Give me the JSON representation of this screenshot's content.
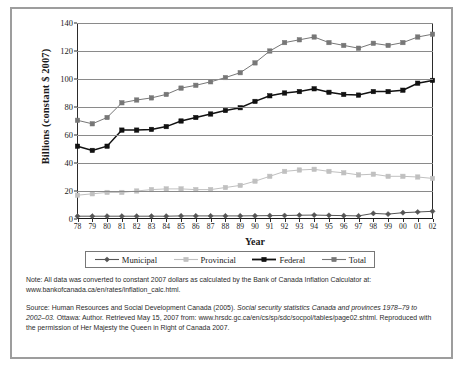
{
  "chart_data": {
    "type": "line",
    "title": "",
    "xlabel": "Year",
    "ylabel": "Billions (constant $ 2007)",
    "ylim": [
      0,
      140
    ],
    "ytick_values": [
      0,
      20,
      40,
      60,
      80,
      100,
      120,
      140
    ],
    "ytick_labels": [
      "0",
      "20",
      "40",
      "60",
      "80",
      "100",
      "120",
      "140"
    ],
    "grid": true,
    "legend_position": "below-axes",
    "categories": [
      "78",
      "79",
      "80",
      "81",
      "82",
      "83",
      "84",
      "85",
      "86",
      "87",
      "88",
      "89",
      "90",
      "91",
      "92",
      "93",
      "94",
      "95",
      "96",
      "97",
      "98",
      "99",
      "00",
      "01",
      "02"
    ],
    "series": [
      {
        "name": "Municipal",
        "color": "#555555",
        "marker": "diamond",
        "values": [
          2.0,
          2.0,
          2.0,
          2.0,
          2.0,
          2.0,
          2.0,
          2.2,
          2.2,
          2.2,
          2.2,
          2.2,
          2.3,
          2.4,
          2.5,
          2.7,
          2.8,
          2.6,
          2.4,
          2.2,
          4.0,
          3.5,
          4.5,
          5.0,
          5.5
        ]
      },
      {
        "name": "Provincial",
        "color": "#c0c0c0",
        "marker": "square",
        "values": [
          17.0,
          18.0,
          19.0,
          19.0,
          20.0,
          21.0,
          21.5,
          21.5,
          21.0,
          21.0,
          22.5,
          24.0,
          27.0,
          30.5,
          34.0,
          35.0,
          35.5,
          34.0,
          33.0,
          31.5,
          32.0,
          30.5,
          30.5,
          30.0,
          29.0
        ]
      },
      {
        "name": "Federal",
        "color": "#111111",
        "marker": "square",
        "values": [
          52.0,
          49.0,
          52.0,
          63.5,
          63.5,
          64.0,
          66.0,
          70.0,
          72.5,
          75.0,
          77.5,
          79.5,
          84.0,
          88.0,
          90.0,
          91.0,
          93.0,
          90.5,
          89.0,
          88.5,
          91.0,
          91.0,
          92.0,
          97.0,
          99.0
        ]
      },
      {
        "name": "Total",
        "color": "#777777",
        "marker": "square",
        "values": [
          70.5,
          68.0,
          72.5,
          83.0,
          85.0,
          86.5,
          89.0,
          93.5,
          95.5,
          98.0,
          101.0,
          104.5,
          111.5,
          120.0,
          126.0,
          128.0,
          130.0,
          126.0,
          124.0,
          122.0,
          125.5,
          124.0,
          126.0,
          130.0,
          132.0
        ]
      }
    ]
  },
  "axis": {
    "y_title": "Billions (constant $ 2007)",
    "x_title": "Year"
  },
  "legend": {
    "items": [
      {
        "label": "Municipal"
      },
      {
        "label": "Provincial"
      },
      {
        "label": "Federal"
      },
      {
        "label": "Total"
      }
    ]
  },
  "notes": {
    "note_text": "Note: All data was converted to constant 2007 dollars as calculated by the Bank of Canada Inflation Calculator at: www.bankofcanada.ca/en/rates/inflation_calc.html.",
    "source_lead": "Source: Human Resources and Social Development Canada (2005). ",
    "source_italic_1": "Social security statistics Canada and provinces 1978–79 to 2002–03.",
    "source_tail": " Ottawa: Author. Retrieved May 15, 2007 from: www.hrsdc.gc.ca/en/cs/sp/sdc/socpol/tables/page02.shtml. Reproduced with the permission of Her Majesty the Queen in Right of Canada 2007."
  }
}
